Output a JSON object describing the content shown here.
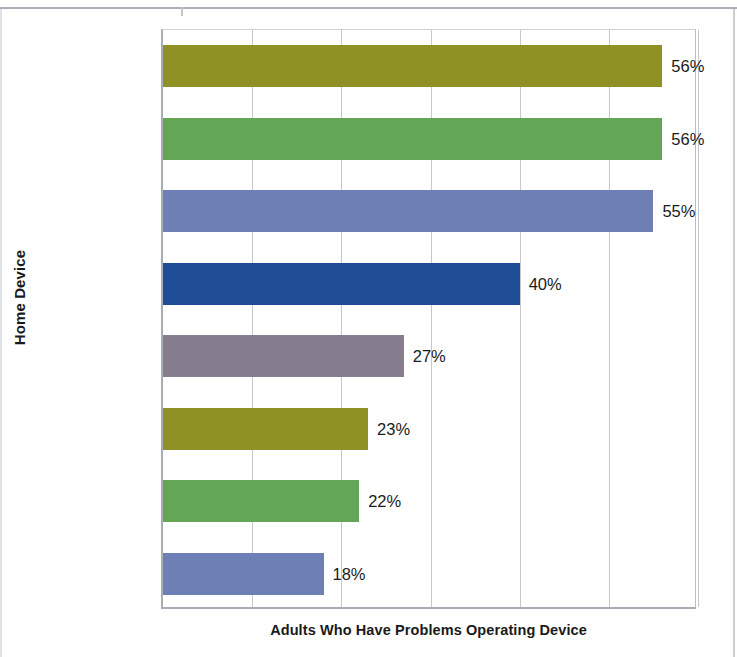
{
  "chart_data": {
    "type": "bar",
    "orientation": "horizontal",
    "title": "",
    "xlabel": "Adults Who Have Problems Operating Device",
    "ylabel": "Home Device",
    "categories": [
      "Cell phone",
      "Computer",
      "Security\nsystem",
      "VCR",
      "Answering\nmachine",
      "Stereo",
      "Microwave",
      "TV"
    ],
    "values": [
      56,
      56,
      55,
      40,
      27,
      23,
      22,
      18
    ],
    "value_labels": [
      "56%",
      "56%",
      "55%",
      "40%",
      "27%",
      "23%",
      "22%",
      "18%"
    ],
    "bar_colors": [
      "#8f9124",
      "#63a756",
      "#6d7fb5",
      "#1f4e96",
      "#867e8e",
      "#8f9124",
      "#63a756",
      "#6d7fb5"
    ],
    "xlim": [
      0,
      60
    ],
    "x_gridlines": [
      0,
      10,
      20,
      30,
      40,
      50,
      60
    ],
    "x_tick_labels": [],
    "grid": true,
    "legend": false,
    "legend_position": "none",
    "axis_color": "#a8adb5",
    "gridline_color": "#c3c7ce"
  }
}
